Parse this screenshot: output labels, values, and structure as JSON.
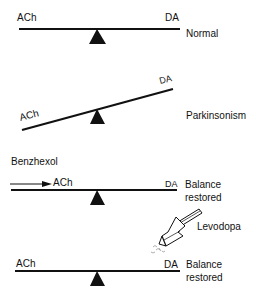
{
  "panels": [
    {
      "id": "normal",
      "left_label": "ACh",
      "right_label": "DA",
      "state": "Normal"
    },
    {
      "id": "parkinsonism",
      "left_label": "ACh",
      "right_label": "DA",
      "state": "Parkinsonism"
    },
    {
      "id": "benzhexol",
      "drug": "Benzhexol",
      "left_label": "ACh",
      "right_label": "DA",
      "state_line1": "Balance",
      "state_line2": "restored"
    },
    {
      "id": "levodopa",
      "drug": "Levodopa",
      "left_label": "ACh",
      "right_label": "DA",
      "state_line1": "Balance",
      "state_line2": "restored"
    }
  ],
  "colors": {
    "ink": "#111111",
    "background": "#ffffff"
  }
}
